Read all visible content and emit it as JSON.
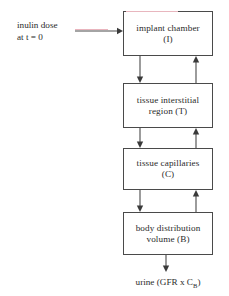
{
  "diagram": {
    "background_color": "#ffffff",
    "line_color": "#4a4a4a",
    "text_color": "#2b2b2b",
    "artifact_color": "#e8b6be",
    "input_label": {
      "line1": "inulin dose",
      "line2": "at  t = 0"
    },
    "output_label": {
      "prefix": "urine (GFR x C",
      "subscript": "B",
      "suffix": ")"
    },
    "boxes": [
      {
        "id": "implant",
        "line1": "implant chamber",
        "line2": "(I)"
      },
      {
        "id": "tissue",
        "line1": "tissue interstitial",
        "line2": "region  (T)"
      },
      {
        "id": "capillary",
        "line1": "tissue capillaries",
        "line2": "(C)"
      },
      {
        "id": "body",
        "line1": "body distribution",
        "line2": "volume  (B)"
      }
    ],
    "connectors": [
      {
        "name": "inulin-dose-to-implant",
        "direction": "right"
      },
      {
        "name": "implant-to-tissue",
        "direction": "down"
      },
      {
        "name": "tissue-to-implant",
        "direction": "up"
      },
      {
        "name": "tissue-to-capillaries",
        "direction": "down"
      },
      {
        "name": "capillaries-to-tissue",
        "direction": "up"
      },
      {
        "name": "capillaries-to-body",
        "direction": "down"
      },
      {
        "name": "body-to-capillaries",
        "direction": "up"
      },
      {
        "name": "body-to-urine",
        "direction": "down"
      }
    ]
  }
}
